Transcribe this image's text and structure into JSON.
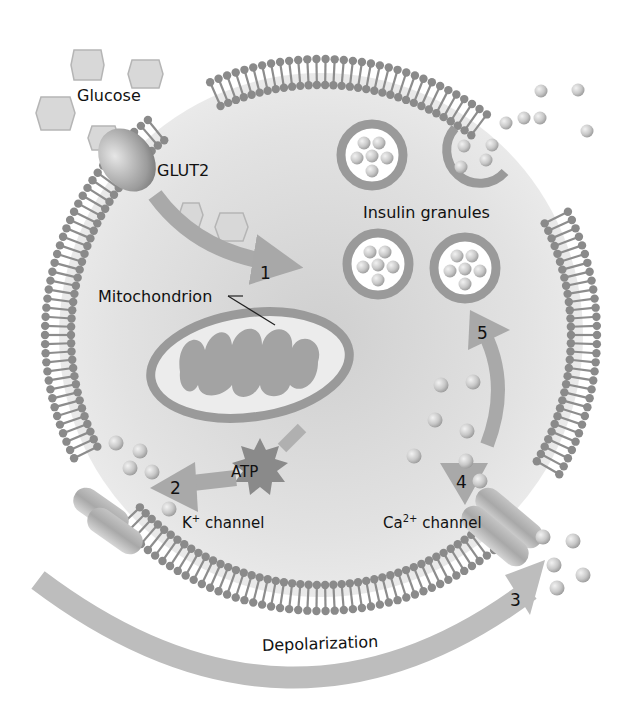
{
  "diagram": {
    "title": "",
    "colors": {
      "background": "#ffffff",
      "cytoplasm": "#e4e4e4",
      "membrane": "#8a8a8a",
      "arrow": "#a9a9a9",
      "text": "#111111"
    },
    "labels": {
      "glucose": "Glucose",
      "glut2": "GLUT2",
      "mitochondrion": "Mitochondrion",
      "insulin_granules": "Insulin granules",
      "atp": "ATP",
      "k_channel_prefix": "K",
      "k_channel_sup": "+",
      "k_channel_suffix": " channel",
      "ca_channel_prefix": "Ca",
      "ca_channel_sup": "2+",
      "ca_channel_suffix": " channel",
      "depolarization": "Depolarization"
    },
    "steps": [
      {
        "id": "1",
        "label": "1",
        "description": "Glucose enters via GLUT2 and is metabolized in mitochondrion"
      },
      {
        "id": "2",
        "label": "2",
        "description": "ATP closes K+ channel"
      },
      {
        "id": "3",
        "label": "3",
        "description": "Depolarization"
      },
      {
        "id": "4",
        "label": "4",
        "description": "Ca2+ channel opens, Ca2+ influx"
      },
      {
        "id": "5",
        "label": "5",
        "description": "Insulin granules exocytosis"
      }
    ]
  }
}
